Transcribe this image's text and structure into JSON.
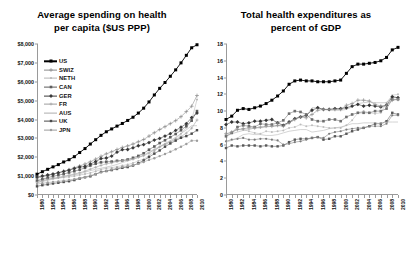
{
  "figure": {
    "background": "#ffffff",
    "width": 408,
    "height": 254
  },
  "chart_data": [
    {
      "id": "spending-per-capita",
      "type": "line",
      "title": "Average spending on health per capita ($US PPP)",
      "title_line1": "Average spending on health",
      "title_line2": "per capita ($US PPP)",
      "xlabel": "",
      "ylabel": "",
      "grid": false,
      "legend_position": "inside-top-left",
      "x": [
        1980,
        1981,
        1982,
        1983,
        1984,
        1985,
        1986,
        1987,
        1988,
        1989,
        1990,
        1991,
        1992,
        1993,
        1994,
        1995,
        1996,
        1997,
        1998,
        1999,
        2000,
        2001,
        2002,
        2003,
        2004,
        2005,
        2006,
        2007,
        2008,
        2009,
        2010
      ],
      "xticklabels": [
        "1980",
        "1982",
        "1984",
        "1986",
        "1988",
        "1990",
        "1992",
        "1994",
        "1996",
        "1998",
        "2000",
        "2002",
        "2004",
        "2006",
        "2008",
        "2010"
      ],
      "yticklabels": [
        "$0",
        "$1,000",
        "$2,000",
        "$3,000",
        "$4,000",
        "$5,000",
        "$6,000",
        "$7,000",
        "$8,000"
      ],
      "ylim": [
        0,
        8000
      ],
      "ytick_values": [
        0,
        1000,
        2000,
        3000,
        4000,
        5000,
        6000,
        7000,
        8000
      ],
      "xlim": [
        1980,
        2010
      ],
      "series": [
        {
          "name": "US",
          "marker": "filled-square",
          "color": "#000000",
          "values": [
            1102,
            1235,
            1360,
            1490,
            1610,
            1750,
            1870,
            2030,
            2250,
            2460,
            2700,
            2930,
            3160,
            3350,
            3500,
            3650,
            3790,
            3950,
            4120,
            4340,
            4600,
            4930,
            5300,
            5650,
            5960,
            6290,
            6630,
            7000,
            7400,
            7800,
            7960
          ]
        },
        {
          "name": "SWIZ",
          "marker": "plus",
          "color": "#8a8a8a",
          "values": [
            900,
            960,
            1030,
            1100,
            1170,
            1250,
            1340,
            1440,
            1540,
            1640,
            1760,
            1900,
            2050,
            2180,
            2290,
            2410,
            2520,
            2600,
            2700,
            2820,
            2940,
            3120,
            3300,
            3470,
            3620,
            3780,
            3940,
            4150,
            4420,
            4700,
            5270
          ]
        },
        {
          "name": "NETH",
          "marker": "dot",
          "color": "#b5b5b5",
          "values": [
            760,
            810,
            860,
            880,
            900,
            930,
            960,
            1000,
            1060,
            1110,
            1170,
            1260,
            1350,
            1420,
            1450,
            1500,
            1560,
            1610,
            1690,
            1800,
            1900,
            2080,
            2310,
            2560,
            2700,
            2830,
            3000,
            3240,
            3570,
            3970,
            5056
          ]
        },
        {
          "name": "CAN",
          "marker": "filled-square-gray",
          "color": "#5c5c5c",
          "values": [
            760,
            830,
            920,
            990,
            1050,
            1110,
            1190,
            1260,
            1340,
            1440,
            1560,
            1660,
            1730,
            1760,
            1770,
            1810,
            1830,
            1880,
            1970,
            2070,
            2210,
            2400,
            2570,
            2750,
            2900,
            3060,
            3230,
            3430,
            3650,
            3940,
            4445
          ]
        },
        {
          "name": "GER",
          "marker": "diamond",
          "color": "#3a3a3a",
          "values": [
            950,
            1010,
            1060,
            1110,
            1180,
            1250,
            1310,
            1400,
            1480,
            1510,
            1640,
            1770,
            1930,
            1960,
            2060,
            2270,
            2400,
            2410,
            2500,
            2610,
            2670,
            2780,
            2910,
            3000,
            3120,
            3250,
            3420,
            3590,
            3780,
            4100,
            4338
          ]
        },
        {
          "name": "FR",
          "marker": "small-plus",
          "color": "#9e9e9e",
          "values": [
            670,
            740,
            820,
            880,
            930,
            1000,
            1050,
            1110,
            1180,
            1260,
            1370,
            1470,
            1570,
            1650,
            1700,
            1780,
            1820,
            1840,
            1900,
            1990,
            2080,
            2220,
            2390,
            2540,
            2680,
            2800,
            2950,
            3090,
            3280,
            3540,
            3974
          ]
        },
        {
          "name": "AUS",
          "marker": "line-only",
          "color": "#adadad",
          "values": [
            660,
            710,
            780,
            840,
            900,
            950,
            1020,
            1060,
            1130,
            1210,
            1290,
            1360,
            1420,
            1480,
            1540,
            1620,
            1720,
            1800,
            1900,
            2000,
            2120,
            2280,
            2420,
            2570,
            2730,
            2880,
            3060,
            3250,
            3450,
            3670,
            3670
          ]
        },
        {
          "name": "UK",
          "marker": "filled-square-dark",
          "color": "#4a4a4a",
          "values": [
            460,
            520,
            560,
            610,
            650,
            690,
            730,
            790,
            870,
            940,
            990,
            1100,
            1220,
            1270,
            1320,
            1380,
            1440,
            1480,
            1560,
            1680,
            1830,
            2010,
            2190,
            2360,
            2560,
            2730,
            2880,
            3030,
            3120,
            3250,
            3433
          ]
        },
        {
          "name": "JPN",
          "marker": "circle-gray",
          "color": "#9c9c9c",
          "values": [
            580,
            620,
            660,
            690,
            720,
            760,
            800,
            840,
            900,
            950,
            1030,
            1110,
            1200,
            1280,
            1350,
            1420,
            1480,
            1530,
            1580,
            1650,
            1750,
            1860,
            1950,
            2060,
            2170,
            2290,
            2420,
            2560,
            2700,
            2880,
            2878
          ]
        }
      ]
    },
    {
      "id": "health-expenditure-percent-gdp",
      "type": "line",
      "title": "Total health expenditures as percent of GDP",
      "title_line1": "Total health expenditures as",
      "title_line2": "percent of GDP",
      "xlabel": "",
      "ylabel": "",
      "grid": false,
      "legend_position": "inside-bottom-right",
      "x": [
        1980,
        1981,
        1982,
        1983,
        1984,
        1985,
        1986,
        1987,
        1988,
        1989,
        1990,
        1991,
        1992,
        1993,
        1994,
        1995,
        1996,
        1997,
        1998,
        1999,
        2000,
        2001,
        2002,
        2003,
        2004,
        2005,
        2006,
        2007,
        2008,
        2009,
        2010
      ],
      "xticklabels": [
        "1980",
        "1982",
        "1984",
        "1986",
        "1988",
        "1990",
        "1992",
        "1994",
        "1996",
        "1998",
        "2000",
        "2002",
        "2004",
        "2006",
        "2008",
        "2010"
      ],
      "yticklabels": [
        "0",
        "2",
        "4",
        "6",
        "8",
        "10",
        "12",
        "14",
        "16",
        "18"
      ],
      "ylim": [
        0,
        18
      ],
      "ytick_values": [
        0,
        2,
        4,
        6,
        8,
        10,
        12,
        14,
        16,
        18
      ],
      "xlim": [
        1980,
        2010
      ],
      "series": [
        {
          "name": "US",
          "marker": "filled-square",
          "color": "#000000",
          "values": [
            9.0,
            9.4,
            10.1,
            10.3,
            10.2,
            10.4,
            10.6,
            10.9,
            11.3,
            11.8,
            12.4,
            13.2,
            13.6,
            13.7,
            13.6,
            13.6,
            13.5,
            13.5,
            13.5,
            13.6,
            13.7,
            14.5,
            15.3,
            15.6,
            15.6,
            15.7,
            15.8,
            16.0,
            16.4,
            17.3,
            17.6
          ]
        },
        {
          "name": "NETH",
          "marker": "dot",
          "color": "#bdbdbd",
          "values": [
            7.2,
            7.5,
            7.8,
            7.8,
            7.6,
            7.4,
            7.3,
            7.6,
            7.5,
            7.6,
            7.7,
            8.0,
            8.1,
            8.4,
            8.2,
            8.3,
            8.2,
            8.1,
            8.0,
            8.0,
            8.0,
            8.3,
            8.9,
            9.8,
            10.0,
            9.8,
            9.7,
            9.8,
            11.0,
            11.9,
            12.0
          ]
        },
        {
          "name": "FR",
          "marker": "line-only",
          "color": "#a8a8a8",
          "values": [
            7.0,
            7.3,
            7.5,
            7.7,
            7.8,
            8.0,
            8.0,
            8.1,
            8.2,
            8.2,
            8.4,
            8.6,
            9.0,
            9.4,
            9.4,
            10.4,
            10.4,
            10.2,
            10.1,
            10.1,
            10.1,
            10.2,
            10.5,
            10.9,
            11.0,
            11.1,
            11.0,
            11.0,
            11.0,
            11.7,
            11.6
          ]
        },
        {
          "name": "GER",
          "marker": "diamond",
          "color": "#343434",
          "values": [
            8.4,
            8.7,
            8.7,
            8.5,
            8.6,
            8.8,
            8.8,
            8.9,
            9.0,
            8.6,
            8.3,
            8.7,
            9.1,
            9.3,
            9.5,
            10.1,
            10.4,
            10.2,
            10.2,
            10.3,
            10.3,
            10.4,
            10.6,
            10.8,
            10.6,
            10.7,
            10.6,
            10.5,
            10.7,
            11.7,
            11.6
          ]
        },
        {
          "name": "CAN",
          "marker": "gray-square",
          "color": "#6e6e6e",
          "values": [
            7.0,
            7.4,
            8.1,
            8.3,
            8.2,
            8.1,
            8.5,
            8.4,
            8.4,
            8.6,
            8.9,
            9.7,
            10.0,
            9.9,
            9.6,
            9.0,
            8.8,
            8.8,
            9.0,
            9.0,
            8.8,
            9.3,
            9.6,
            9.8,
            9.8,
            9.8,
            10.0,
            10.0,
            10.3,
            11.4,
            11.4
          ]
        },
        {
          "name": "SWIZ",
          "marker": "plus",
          "color": "#8f8f8f",
          "values": [
            7.3,
            7.5,
            7.8,
            7.9,
            8.0,
            8.0,
            8.1,
            8.2,
            8.2,
            8.3,
            8.2,
            8.6,
            9.0,
            9.3,
            9.2,
            9.6,
            10.1,
            10.2,
            10.2,
            10.2,
            10.2,
            10.7,
            10.9,
            11.3,
            11.3,
            11.2,
            10.8,
            10.6,
            10.7,
            11.3,
            11.4
          ]
        },
        {
          "name": "UK",
          "marker": "small-square",
          "color": "#585858",
          "values": [
            5.6,
            5.9,
            5.8,
            5.9,
            5.9,
            5.9,
            5.8,
            5.9,
            5.8,
            5.8,
            5.9,
            6.3,
            6.6,
            6.7,
            6.7,
            6.8,
            6.9,
            6.6,
            6.7,
            7.0,
            7.0,
            7.3,
            7.6,
            7.8,
            8.0,
            8.2,
            8.5,
            8.5,
            8.8,
            9.8,
            9.6
          ]
        },
        {
          "name": "JPN",
          "marker": "dot-dark",
          "color": "#7a7a7a",
          "values": [
            6.4,
            6.6,
            6.7,
            6.8,
            6.6,
            6.6,
            6.7,
            6.7,
            6.6,
            6.5,
            6.0,
            6.1,
            6.3,
            6.4,
            6.6,
            6.8,
            6.9,
            6.8,
            7.3,
            7.5,
            7.6,
            7.8,
            7.9,
            8.0,
            8.0,
            8.2,
            8.2,
            8.2,
            8.5,
            9.5,
            9.5
          ]
        },
        {
          "name": "AUS",
          "marker": "line-only-light",
          "color": "#b0b0b0",
          "values": [
            6.3,
            6.5,
            6.8,
            7.2,
            7.3,
            7.2,
            7.2,
            7.1,
            7.1,
            7.2,
            7.4,
            7.6,
            7.7,
            7.8,
            7.8,
            7.5,
            7.6,
            7.7,
            7.9,
            8.0,
            8.1,
            8.3,
            8.5,
            8.5,
            8.6,
            8.6,
            8.6,
            8.5,
            8.7,
            8.7,
            8.7
          ]
        }
      ]
    }
  ],
  "left_chart": {
    "legend": [
      {
        "label": "US"
      },
      {
        "label": "SWIZ"
      },
      {
        "label": "NETH"
      },
      {
        "label": "CAN"
      },
      {
        "label": "GER"
      },
      {
        "label": "FR"
      },
      {
        "label": "AUS"
      },
      {
        "label": "UK"
      },
      {
        "label": "JPN"
      }
    ]
  },
  "right_chart": {
    "legend": [
      {
        "label": "US"
      },
      {
        "label": "NETH"
      },
      {
        "label": "FR"
      },
      {
        "label": "GER"
      },
      {
        "label": "CAN"
      },
      {
        "label": "SWIZ"
      },
      {
        "label": "UK"
      },
      {
        "label": "JPN"
      },
      {
        "label": "AUS"
      }
    ]
  }
}
